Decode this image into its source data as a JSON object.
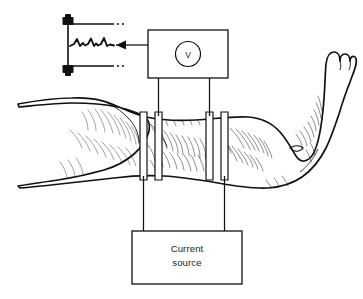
{
  "instruments": {
    "voltmeter": {
      "name": "voltmeter-box",
      "symbol": "V",
      "symbol_shape": "circle"
    },
    "current_source": {
      "name": "current-source-box",
      "label_line1": "Current",
      "label_line2": "source"
    },
    "recorder": {
      "name": "waveform-display",
      "trace": "pulsatile-waveform",
      "peaks": 3,
      "terminals": 2
    }
  },
  "connections": [
    {
      "from": "voltmeter-box",
      "to": "electrode-inner-left",
      "type": "wire"
    },
    {
      "from": "voltmeter-box",
      "to": "electrode-inner-right",
      "type": "wire"
    },
    {
      "from": "current-source-box",
      "to": "electrode-outer-left",
      "type": "wire"
    },
    {
      "from": "current-source-box",
      "to": "electrode-outer-right",
      "type": "wire"
    },
    {
      "from": "voltmeter-box",
      "to": "waveform-display",
      "type": "arrow",
      "direction": "left"
    }
  ],
  "electrodes": [
    {
      "name": "electrode-outer-left",
      "role": "current-injecting"
    },
    {
      "name": "electrode-inner-left",
      "role": "voltage-sensing"
    },
    {
      "name": "electrode-inner-right",
      "role": "voltage-sensing"
    },
    {
      "name": "electrode-outer-right",
      "role": "current-injecting"
    }
  ],
  "anatomy": {
    "limb": "right leg",
    "parts": [
      "thigh",
      "knee",
      "calf",
      "ankle",
      "foot",
      "toes"
    ]
  },
  "colors": {
    "ink": "#111111",
    "background": "#ffffff",
    "hatch": "#1d1d1d"
  }
}
